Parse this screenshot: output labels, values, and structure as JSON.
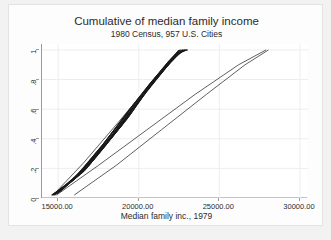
{
  "chart_data": {
    "type": "line",
    "title": "Cumulative of median family income",
    "subtitle": "1980 Census, 957 U.S. Cities",
    "xlabel": "Median family inc., 1979",
    "ylabel": "",
    "xlim": [
      14000,
      30500
    ],
    "ylim": [
      0,
      1.04
    ],
    "xticks": [
      15000,
      20000,
      25000,
      30000
    ],
    "xticklabels": [
      "15000.00",
      "20000.00",
      "25000.00",
      "30000.00"
    ],
    "yticks": [
      0,
      0.2,
      0.4,
      0.6,
      0.8,
      1
    ],
    "yticklabels": [
      "0",
      ".2",
      ".4",
      ".6",
      ".8",
      "1"
    ],
    "grid": true,
    "legend": "none",
    "line_color": "#1a1a1a",
    "series": [
      {
        "name": "cdf-001",
        "x": [
          14760,
          16300,
          18100,
          19700,
          21000,
          22050,
          22680
        ],
        "y": [
          0.02,
          0.16,
          0.39,
          0.62,
          0.8,
          0.94,
          1.0
        ]
      },
      {
        "name": "cdf-002",
        "x": [
          14820,
          16400,
          18250,
          19850,
          21150,
          22150,
          22720
        ],
        "y": [
          0.02,
          0.17,
          0.41,
          0.64,
          0.82,
          0.95,
          1.0
        ]
      },
      {
        "name": "cdf-003",
        "x": [
          14700,
          16200,
          17950,
          19550,
          20850,
          21950,
          22600
        ],
        "y": [
          0.02,
          0.15,
          0.38,
          0.61,
          0.79,
          0.93,
          1.0
        ]
      },
      {
        "name": "cdf-004",
        "x": [
          14900,
          16550,
          18450,
          20050,
          21300,
          22250,
          22800
        ],
        "y": [
          0.03,
          0.18,
          0.43,
          0.66,
          0.83,
          0.96,
          1.0
        ]
      },
      {
        "name": "cdf-005",
        "x": [
          14650,
          16100,
          17800,
          19400,
          20700,
          21850,
          22550
        ],
        "y": [
          0.02,
          0.14,
          0.36,
          0.59,
          0.77,
          0.92,
          1.0
        ]
      },
      {
        "name": "cdf-006",
        "x": [
          14980,
          16700,
          18600,
          20200,
          21420,
          22330,
          22860
        ],
        "y": [
          0.03,
          0.19,
          0.45,
          0.68,
          0.85,
          0.97,
          1.0
        ]
      },
      {
        "name": "cdf-007",
        "x": [
          14740,
          16350,
          18200,
          19800,
          21080,
          22100,
          22700
        ],
        "y": [
          0.02,
          0.16,
          0.4,
          0.63,
          0.81,
          0.94,
          1.0
        ]
      },
      {
        "name": "cdf-008",
        "x": [
          15050,
          16850,
          18780,
          20340,
          21520,
          22400,
          22900
        ],
        "y": [
          0.04,
          0.21,
          0.47,
          0.7,
          0.86,
          0.97,
          1.0
        ]
      },
      {
        "name": "cdf-009",
        "x": [
          14680,
          16150,
          17880,
          19480,
          20780,
          21900,
          22580
        ],
        "y": [
          0.02,
          0.15,
          0.37,
          0.6,
          0.78,
          0.93,
          1.0
        ]
      },
      {
        "name": "cdf-010",
        "x": [
          14860,
          16470,
          18330,
          19930,
          21220,
          22200,
          22760
        ],
        "y": [
          0.03,
          0.17,
          0.42,
          0.65,
          0.82,
          0.95,
          1.0
        ]
      },
      {
        "name": "cdf-011",
        "x": [
          15120,
          17000,
          18950,
          20460,
          21600,
          22460,
          22940
        ],
        "y": [
          0.04,
          0.23,
          0.49,
          0.72,
          0.87,
          0.98,
          1.0
        ]
      },
      {
        "name": "cdf-012",
        "x": [
          14620,
          16050,
          17720,
          19320,
          20640,
          21800,
          22520
        ],
        "y": [
          0.02,
          0.13,
          0.35,
          0.58,
          0.76,
          0.91,
          1.0
        ]
      },
      {
        "name": "cdf-013",
        "x": [
          14800,
          16380,
          18230,
          19830,
          21120,
          22130,
          22710
        ],
        "y": [
          0.02,
          0.16,
          0.4,
          0.63,
          0.81,
          0.94,
          1.0
        ]
      },
      {
        "name": "cdf-014",
        "x": [
          15180,
          17150,
          19100,
          20560,
          21680,
          22510,
          22970
        ],
        "y": [
          0.05,
          0.25,
          0.51,
          0.73,
          0.88,
          0.98,
          1.0
        ]
      },
      {
        "name": "cdf-015",
        "x": [
          14580,
          15980,
          17640,
          19240,
          20580,
          21760,
          22490
        ],
        "y": [
          0.02,
          0.12,
          0.34,
          0.57,
          0.75,
          0.91,
          1.0
        ]
      },
      {
        "name": "cdf-016",
        "x": [
          14930,
          16610,
          18520,
          20120,
          21360,
          22290,
          22830
        ],
        "y": [
          0.03,
          0.18,
          0.44,
          0.67,
          0.84,
          0.96,
          1.0
        ]
      },
      {
        "name": "cdf-017",
        "x": [
          14710,
          16260,
          18040,
          19640,
          20930,
          22000,
          22640
        ],
        "y": [
          0.02,
          0.15,
          0.38,
          0.62,
          0.8,
          0.93,
          1.0
        ]
      },
      {
        "name": "cdf-018",
        "x": [
          15260,
          17320,
          19260,
          20660,
          21760,
          22560,
          23000
        ],
        "y": [
          0.06,
          0.27,
          0.53,
          0.75,
          0.89,
          0.98,
          1.0
        ]
      },
      {
        "name": "cdf-019",
        "x": [
          14880,
          16520,
          18400,
          20000,
          21270,
          22230,
          22790
        ],
        "y": [
          0.03,
          0.18,
          0.43,
          0.66,
          0.83,
          0.96,
          1.0
        ]
      },
      {
        "name": "cdf-020",
        "x": [
          14640,
          16080,
          17760,
          19360,
          20670,
          21820,
          22530
        ],
        "y": [
          0.02,
          0.14,
          0.36,
          0.59,
          0.77,
          0.92,
          1.0
        ]
      },
      {
        "name": "cdf-021",
        "x": [
          15000,
          16760,
          18680,
          20250,
          21460,
          22360,
          22880
        ],
        "y": [
          0.04,
          0.2,
          0.46,
          0.69,
          0.85,
          0.97,
          1.0
        ]
      },
      {
        "name": "cdf-022",
        "x": [
          14770,
          16420,
          18290,
          19890,
          21180,
          22170,
          22740
        ],
        "y": [
          0.02,
          0.17,
          0.41,
          0.64,
          0.82,
          0.95,
          1.0
        ]
      },
      {
        "name": "cdf-023",
        "x": [
          15340,
          17500,
          19400,
          20760,
          21830,
          22600,
          23030
        ],
        "y": [
          0.07,
          0.3,
          0.55,
          0.76,
          0.9,
          0.99,
          1.0
        ]
      },
      {
        "name": "cdf-024",
        "x": [
          14600,
          16010,
          17680,
          19280,
          20610,
          21780,
          22500
        ],
        "y": [
          0.02,
          0.13,
          0.35,
          0.57,
          0.76,
          0.91,
          1.0
        ]
      },
      {
        "name": "cdf-025",
        "x": [
          14950,
          16650,
          18560,
          20160,
          21400,
          22310,
          22840
        ],
        "y": [
          0.03,
          0.19,
          0.44,
          0.67,
          0.84,
          0.96,
          1.0
        ]
      },
      {
        "name": "cdf-026",
        "x": [
          14730,
          16310,
          18120,
          19720,
          21010,
          22060,
          22680
        ],
        "y": [
          0.02,
          0.16,
          0.39,
          0.62,
          0.8,
          0.94,
          1.0
        ]
      },
      {
        "name": "cdf-027",
        "x": [
          15080,
          16920,
          18860,
          20400,
          21560,
          22430,
          22920
        ],
        "y": [
          0.04,
          0.22,
          0.48,
          0.71,
          0.86,
          0.98,
          1.0
        ]
      },
      {
        "name": "cdf-028",
        "x": [
          14840,
          16440,
          18310,
          19910,
          21200,
          22190,
          22750
        ],
        "y": [
          0.03,
          0.17,
          0.41,
          0.64,
          0.82,
          0.95,
          1.0
        ]
      },
      {
        "name": "cdf-029",
        "x": [
          14670,
          16120,
          17840,
          19440,
          20740,
          21870,
          22560
        ],
        "y": [
          0.02,
          0.15,
          0.37,
          0.6,
          0.78,
          0.92,
          1.0
        ]
      },
      {
        "name": "cdf-030",
        "x": [
          15420,
          17700,
          19520,
          20840,
          21880,
          22630,
          23050
        ],
        "y": [
          0.08,
          0.32,
          0.57,
          0.78,
          0.91,
          0.99,
          1.0
        ]
      },
      {
        "name": "outlier-left-1",
        "x": [
          14780,
          16600,
          18800,
          20800,
          22400,
          22860
        ],
        "y": [
          0.03,
          0.24,
          0.52,
          0.78,
          0.96,
          1.0
        ]
      },
      {
        "name": "outlier-shallow-1",
        "x": [
          14900,
          17500,
          20500,
          23500,
          26200,
          27900
        ],
        "y": [
          0.02,
          0.22,
          0.46,
          0.7,
          0.9,
          1.0
        ]
      },
      {
        "name": "outlier-shallow-2",
        "x": [
          16000,
          18600,
          21400,
          24200,
          26600,
          28050
        ],
        "y": [
          0.02,
          0.22,
          0.46,
          0.7,
          0.9,
          1.0
        ]
      }
    ]
  }
}
